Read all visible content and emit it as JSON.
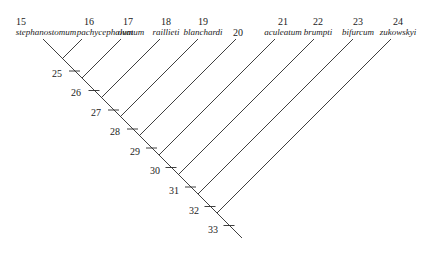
{
  "diagram": {
    "type": "cladogram",
    "taxa": [
      {
        "number": "15",
        "name": "stephanostomum",
        "x": 43
      },
      {
        "number": "16",
        "name": "pachycephalum",
        "x": 82
      },
      {
        "number": "17",
        "name": "ovatum",
        "x": 121
      },
      {
        "number": "18",
        "name": "raillieti",
        "x": 160
      },
      {
        "number": "19",
        "name": "blanchardi",
        "x": 198
      },
      {
        "number": "20",
        "name": "",
        "x": 236
      },
      {
        "number": "21",
        "name": "aculeatum",
        "x": 275
      },
      {
        "number": "22",
        "name": "brumpti",
        "x": 314
      },
      {
        "number": "23",
        "name": "bifurcum",
        "x": 353
      },
      {
        "number": "24",
        "name": "zukowskyi",
        "x": 391
      }
    ],
    "internal_nodes": [
      "25",
      "26",
      "27",
      "28",
      "29",
      "30",
      "31",
      "32",
      "33"
    ],
    "line_color": "#2a2a2a"
  }
}
